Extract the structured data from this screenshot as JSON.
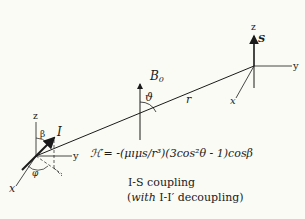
{
  "diagram": {
    "title": "I-S coupling",
    "subtitle_prefix": "(",
    "subtitle_with": "with",
    "subtitle_rest": " I-I′ decoupling)",
    "formula": "ℋ′= -(μıμs/r³)(3cos²θ - 1)cosβ",
    "field_label": "B",
    "field_subscript": "0",
    "angle_theta": "ϑ",
    "distance_label": "r",
    "spin_I": {
      "label": "I",
      "axes": {
        "z": "z",
        "y": "y",
        "x": "x"
      },
      "angle_beta": "β",
      "angle_phi": "φ"
    },
    "spin_S": {
      "label": "S",
      "axes": {
        "z": "z",
        "y": "y",
        "x": "x"
      }
    },
    "colors": {
      "ink": "#1a1a1a",
      "background": "#fbfbf5"
    }
  }
}
